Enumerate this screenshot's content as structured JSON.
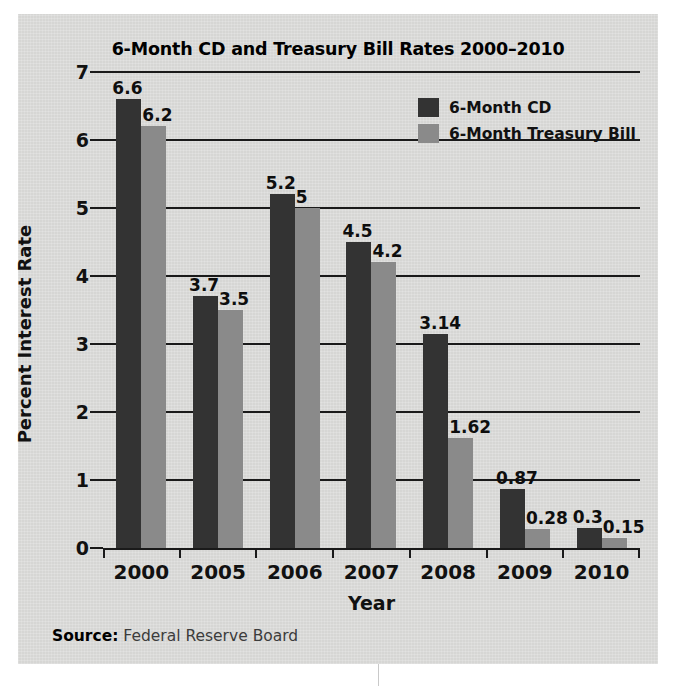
{
  "chart_data": {
    "type": "bar",
    "title": "6-Month CD and Treasury Bill Rates 2000–2010",
    "xlabel": "Year",
    "ylabel": "Percent Interest Rate",
    "ylim": [
      0,
      7
    ],
    "yticks": [
      "0",
      "1",
      "2",
      "3",
      "4",
      "5",
      "6",
      "7"
    ],
    "grid": true,
    "legend_position": "top-right",
    "categories": [
      "2000",
      "2005",
      "2006",
      "2007",
      "2008",
      "2009",
      "2010"
    ],
    "series": [
      {
        "name": "6-Month CD",
        "color": "#333333",
        "values": [
          6.6,
          3.7,
          5.2,
          4.5,
          3.14,
          0.87,
          0.3
        ],
        "labels": [
          "6.6",
          "3.7",
          "5.2",
          "4.5",
          "3.14",
          "0.87",
          "0.3"
        ]
      },
      {
        "name": "6-Month Treasury Bill",
        "color": "#8a8a8a",
        "values": [
          6.2,
          3.5,
          5.0,
          4.2,
          1.62,
          0.28,
          0.15
        ],
        "labels": [
          "6.2",
          "3.5",
          "5",
          "4.2",
          "1.62",
          "0.28",
          "0.15"
        ]
      }
    ]
  },
  "legend": [
    {
      "label": "6-Month CD",
      "swatch": "cd"
    },
    {
      "label": "6-Month Treasury Bill",
      "swatch": "tb"
    }
  ],
  "source": {
    "label": "Source:",
    "value": " Federal Reserve Board"
  }
}
